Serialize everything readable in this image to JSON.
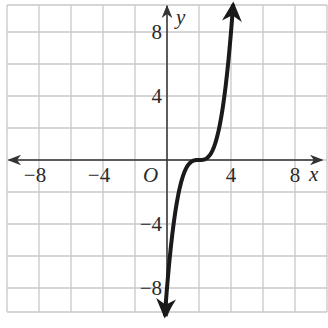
{
  "chart_data": {
    "type": "line",
    "title": "",
    "function": "y = (x - 2)^3",
    "xlabel": "x",
    "ylabel": "y",
    "origin_label": "O",
    "xlim": [
      -10,
      10
    ],
    "ylim": [
      -9.5,
      10
    ],
    "grid": true,
    "grid_step": 2,
    "x_ticks": [
      {
        "value": -8,
        "label": "−8"
      },
      {
        "value": -4,
        "label": "−4"
      },
      {
        "value": 4,
        "label": "4"
      },
      {
        "value": 8,
        "label": "8"
      }
    ],
    "y_ticks": [
      {
        "value": 8,
        "label": "8"
      },
      {
        "value": 4,
        "label": "4"
      },
      {
        "value": -4,
        "label": "−4"
      },
      {
        "value": -8,
        "label": "−8"
      }
    ],
    "series": [
      {
        "name": "curve",
        "x": [
          -0.1,
          0,
          0.5,
          1,
          1.5,
          2,
          2.5,
          3,
          3.5,
          4,
          4.15
        ],
        "y": [
          -9.26,
          -8,
          -3.375,
          -1,
          -0.125,
          0,
          0.125,
          1,
          3.375,
          8,
          9.94
        ],
        "arrows": "both ends"
      }
    ],
    "colors": {
      "grid": "#c8c8c8",
      "axis": "#333333",
      "curve": "#1a1a1a",
      "text": "#2a2a2a"
    }
  }
}
